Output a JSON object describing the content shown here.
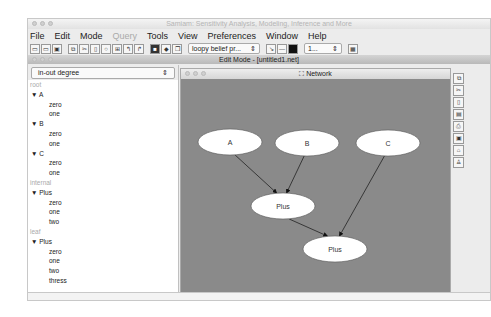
{
  "window": {
    "title": "Samiam: Sensitivity Analysis, Modeling, Inference and More"
  },
  "menu": [
    "File",
    "Edit",
    "Mode",
    "Query",
    "Tools",
    "View",
    "Preferences",
    "Window",
    "Help"
  ],
  "menu_disabled": [
    "Query"
  ],
  "toolbar": {
    "icons": [
      "new-file-icon",
      "open-file-icon",
      "save-file-icon",
      "copy-icon",
      "cut-icon",
      "paste-icon",
      "circle-icon",
      "grid-icon",
      "undo-icon",
      "redo-icon",
      "query-mode-icon",
      "evidence-icon",
      "window-icon"
    ],
    "algorithm_select": "loopy belief pr...",
    "zoom_select": "1...",
    "arrow_tools": [
      "edge-tool-icon",
      "ruler-icon",
      "monitor-icon"
    ],
    "extra": "panel-icon"
  },
  "editmode": {
    "title": "Edit Mode - [untitled1.net]"
  },
  "left_panel": {
    "dropdown": "in-out degree",
    "tree": [
      {
        "type": "category",
        "label": "root"
      },
      {
        "type": "node",
        "label": "A"
      },
      {
        "type": "value",
        "label": "zero"
      },
      {
        "type": "value",
        "label": "one"
      },
      {
        "type": "node",
        "label": "B"
      },
      {
        "type": "value",
        "label": "zero"
      },
      {
        "type": "value",
        "label": "one"
      },
      {
        "type": "node",
        "label": "C"
      },
      {
        "type": "value",
        "label": "zero"
      },
      {
        "type": "value",
        "label": "one"
      },
      {
        "type": "category",
        "label": "internal"
      },
      {
        "type": "node",
        "label": "Plus"
      },
      {
        "type": "value",
        "label": "zero"
      },
      {
        "type": "value",
        "label": "one"
      },
      {
        "type": "value",
        "label": "two"
      },
      {
        "type": "category",
        "label": "leaf"
      },
      {
        "type": "node",
        "label": "Plus"
      },
      {
        "type": "value",
        "label": "zero"
      },
      {
        "type": "value",
        "label": "one"
      },
      {
        "type": "value",
        "label": "two"
      },
      {
        "type": "value",
        "label": "thress"
      }
    ]
  },
  "network": {
    "title": "Network",
    "nodes": [
      {
        "id": "A",
        "label": "A",
        "cx": 49,
        "cy": 63
      },
      {
        "id": "B",
        "label": "B",
        "cx": 126,
        "cy": 64
      },
      {
        "id": "C",
        "label": "C",
        "cx": 207,
        "cy": 64
      },
      {
        "id": "P1",
        "label": "Plus",
        "cx": 102,
        "cy": 127
      },
      {
        "id": "P2",
        "label": "Plus",
        "cx": 154,
        "cy": 170
      }
    ],
    "edges": [
      [
        "A",
        "P1"
      ],
      [
        "B",
        "P1"
      ],
      [
        "C",
        "P2"
      ],
      [
        "P1",
        "P2"
      ]
    ]
  },
  "side_tools": [
    "copy-icon",
    "cut-icon",
    "paste-icon",
    "table-icon",
    "printer-icon",
    "save-icon",
    "lock-icon",
    "user-icon"
  ]
}
